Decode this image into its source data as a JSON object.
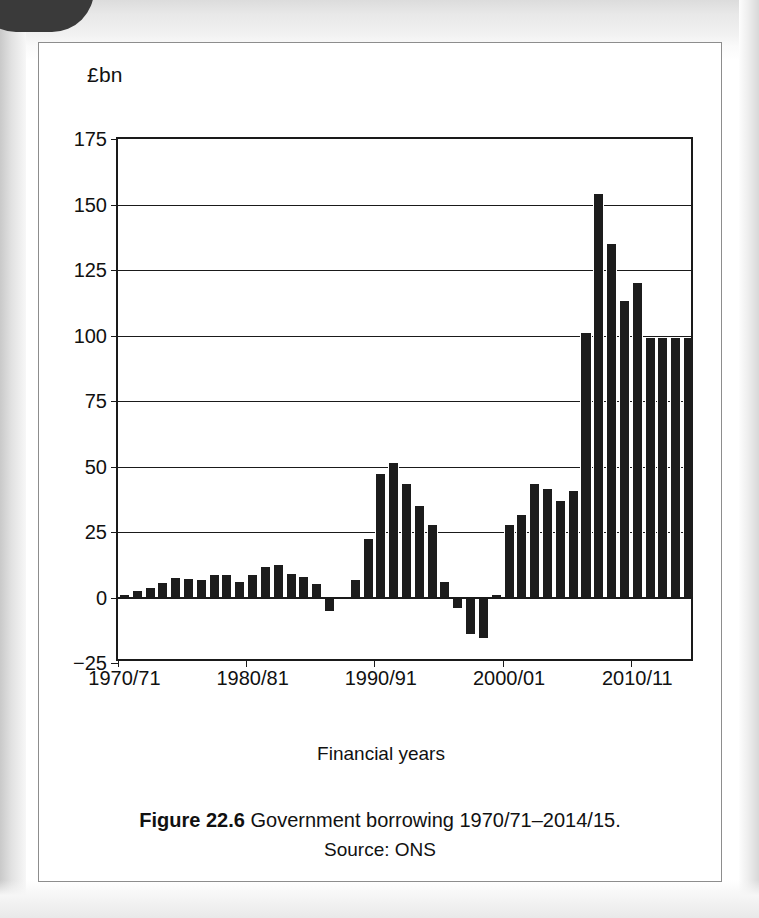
{
  "figure": {
    "caption_number": "Figure 22.6",
    "caption_text": "Government borrowing 1970/71–2014/15.",
    "source": "Source: ONS"
  },
  "chart_data": {
    "type": "bar",
    "title": "Government borrowing 1970/71–2014/15",
    "xlabel": "Financial years",
    "ylabel": "£bn",
    "y_unit_label": "£bn",
    "ylim": [
      -25,
      175
    ],
    "y_ticks": [
      175,
      150,
      125,
      100,
      75,
      50,
      25,
      0,
      -25
    ],
    "y_tick_labels": [
      "175",
      "150",
      "125",
      "100",
      "75",
      "50",
      "25",
      "0",
      "−25"
    ],
    "grid": true,
    "legend": "none",
    "bar_color": "#1c1c1c",
    "x_tick_labels": [
      "1970/71",
      "1980/81",
      "1990/91",
      "2000/01",
      "2010/11"
    ],
    "x_tick_categories": [
      "1970/71",
      "1980/81",
      "1990/91",
      "2000/01",
      "2010/11"
    ],
    "categories": [
      "1970/71",
      "1971/72",
      "1972/73",
      "1973/74",
      "1974/75",
      "1975/76",
      "1976/77",
      "1977/78",
      "1978/79",
      "1979/80",
      "1980/81",
      "1981/82",
      "1982/83",
      "1983/84",
      "1984/85",
      "1985/86",
      "1986/87",
      "1987/88",
      "1988/89",
      "1989/90",
      "1990/91",
      "1991/92",
      "1992/93",
      "1993/94",
      "1994/95",
      "1995/96",
      "1996/97",
      "1997/98",
      "1998/99",
      "1999/00",
      "2000/01",
      "2001/02",
      "2002/03",
      "2003/04",
      "2004/05",
      "2005/06",
      "2006/07",
      "2007/08",
      "2008/09",
      "2009/10",
      "2010/11",
      "2011/12",
      "2012/13",
      "2013/14",
      "2014/15"
    ],
    "values": [
      1,
      2.5,
      3.5,
      5.5,
      7.5,
      7,
      6.5,
      8.5,
      8.5,
      6,
      8.5,
      11.5,
      12.5,
      9,
      8,
      5,
      -5,
      -0.5,
      6.5,
      22.5,
      47,
      51.5,
      43.5,
      35,
      27.5,
      6,
      -4,
      -14,
      -15.5,
      1,
      27.5,
      31.5,
      43.5,
      41.5,
      37,
      40.5,
      101,
      154,
      135,
      113,
      120,
      99,
      99,
      99,
      99
    ],
    "annotations": {
      "peak_label": "154",
      "peak_category": "2007/08",
      "min_label": "−15.5",
      "min_category": "1998/99"
    }
  }
}
